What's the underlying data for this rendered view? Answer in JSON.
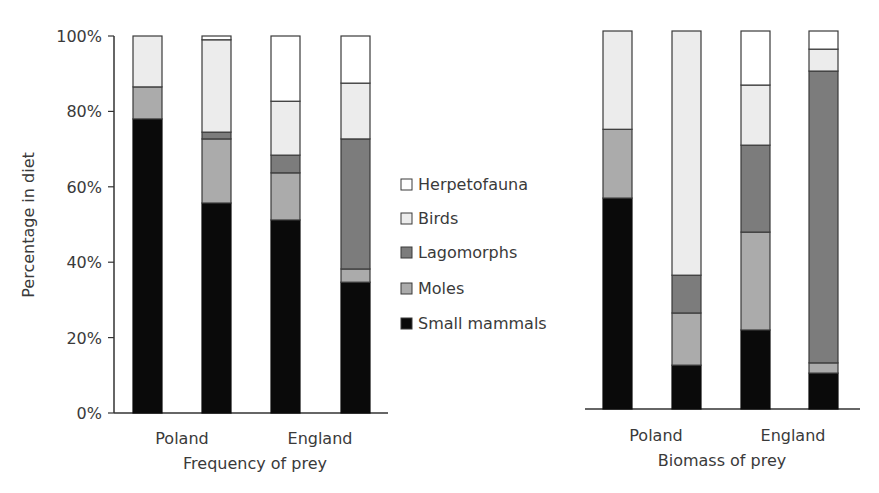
{
  "chart_data": [
    {
      "type": "bar",
      "stacked": true,
      "title": "",
      "xlabel": "Frequency of prey",
      "ylabel": "Percentage in diet",
      "ylim": [
        0,
        100
      ],
      "yticks": [
        "0%",
        "20%",
        "40%",
        "60%",
        "80%",
        "100%"
      ],
      "group_labels": [
        "Poland",
        "England"
      ],
      "categories": [
        "Poland 1",
        "Poland 2",
        "England 1",
        "England 2"
      ],
      "series": [
        {
          "name": "Small mammals",
          "values": [
            78,
            55.7,
            51.2,
            34.7
          ]
        },
        {
          "name": "Moles",
          "values": [
            8.5,
            17,
            12.5,
            3.5
          ]
        },
        {
          "name": "Lagomorphs",
          "values": [
            0,
            1.8,
            4.7,
            34.5
          ]
        },
        {
          "name": "Birds",
          "values": [
            13.5,
            24.5,
            14.3,
            14.8
          ]
        },
        {
          "name": "Herpetofauna",
          "values": [
            0,
            1,
            17.3,
            12.5
          ]
        }
      ],
      "grid": false
    },
    {
      "type": "bar",
      "stacked": true,
      "title": "",
      "xlabel": "Biomass of prey",
      "ylabel": "",
      "ylim": [
        0,
        100
      ],
      "group_labels": [
        "Poland",
        "England"
      ],
      "categories": [
        "Poland 1",
        "Poland 2",
        "England 1",
        "England 2"
      ],
      "series": [
        {
          "name": "Small mammals",
          "values": [
            55.8,
            11.6,
            20.9,
            9.5
          ]
        },
        {
          "name": "Moles",
          "values": [
            18.2,
            13.8,
            25.9,
            2.7
          ]
        },
        {
          "name": "Lagomorphs",
          "values": [
            0,
            10,
            23,
            77.2
          ]
        },
        {
          "name": "Birds",
          "values": [
            26,
            64.6,
            15.9,
            5.8
          ]
        },
        {
          "name": "Herpetofauna",
          "values": [
            0,
            0,
            14.3,
            4.8
          ]
        }
      ],
      "grid": false
    }
  ],
  "legend": {
    "items": [
      {
        "label": "Herpetofauna",
        "color": "#ffffff"
      },
      {
        "label": "Birds",
        "color": "#ececec"
      },
      {
        "label": "Lagomorphs",
        "color": "#7c7c7c"
      },
      {
        "label": "Moles",
        "color": "#ababab"
      },
      {
        "label": "Small mammals",
        "color": "#0a0a0a"
      }
    ]
  },
  "colors": {
    "Small mammals": "#0a0a0a",
    "Moles": "#ababab",
    "Lagomorphs": "#7c7c7c",
    "Birds": "#ececec",
    "Herpetofauna": "#ffffff"
  }
}
